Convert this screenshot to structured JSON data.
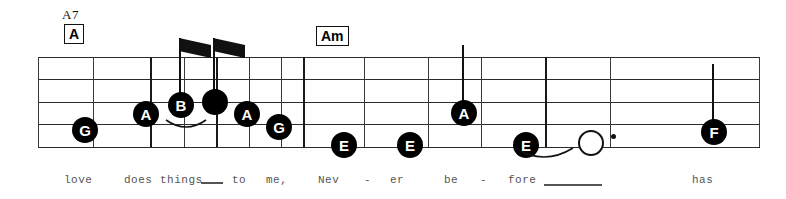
{
  "page": {
    "width": 786,
    "height": 199,
    "background": "#ffffff",
    "ink_color": "#111111",
    "staff_line_color": "#2b2b2b",
    "lyric_color": "#555555"
  },
  "staff": {
    "name": "music-staff",
    "line_count": 5,
    "left": 38,
    "right": 760,
    "top_y": 57,
    "line_spacing": 22.5,
    "line_ys": [
      57,
      79,
      102,
      124,
      147
    ]
  },
  "chords": [
    {
      "label": "A7",
      "boxed": false,
      "x": 62,
      "y": 7
    },
    {
      "label": "A",
      "boxed": true,
      "x": 64,
      "y": 24
    },
    {
      "label": "Am",
      "boxed": true,
      "x": 316,
      "y": 26
    }
  ],
  "barlines": [
    {
      "name": "barline-m1-open",
      "x": 38,
      "style": "thin"
    },
    {
      "name": "barline-m1-a",
      "x": 93,
      "style": "thin"
    },
    {
      "name": "barline-m1-b",
      "x": 150,
      "style": "thick"
    },
    {
      "name": "barline-m1-c",
      "x": 184,
      "style": "thin"
    },
    {
      "name": "barline-m1-d",
      "x": 216,
      "style": "thick"
    },
    {
      "name": "barline-m1-e",
      "x": 249,
      "style": "thin"
    },
    {
      "name": "barline-m1-f",
      "x": 281,
      "style": "thin"
    },
    {
      "name": "barline-measure-1-end",
      "x": 303,
      "style": "thick"
    },
    {
      "name": "barline-m2-a",
      "x": 364,
      "style": "thin"
    },
    {
      "name": "barline-m2-b",
      "x": 428,
      "style": "thin"
    },
    {
      "name": "barline-m2-c",
      "x": 481,
      "style": "thin"
    },
    {
      "name": "barline-measure-2-end",
      "x": 545,
      "style": "thick"
    },
    {
      "name": "barline-m3-a",
      "x": 610,
      "style": "thin"
    },
    {
      "name": "barline-staff-end",
      "x": 759,
      "style": "thin"
    }
  ],
  "notes": [
    {
      "name": "note-g-1",
      "letter": "G",
      "x": 72,
      "cy": 130,
      "head": "filled",
      "stem": "none",
      "flag": false
    },
    {
      "name": "note-a-1",
      "letter": "A",
      "x": 133,
      "cy": 114,
      "head": "filled",
      "stem": "none",
      "flag": false
    },
    {
      "name": "note-b-1",
      "letter": "B",
      "x": 168,
      "cy": 105,
      "head": "filled",
      "stem": "up",
      "stem_top": 38,
      "flag": true
    },
    {
      "name": "note-unlabeled-1",
      "letter": "",
      "x": 202,
      "cy": 102,
      "head": "blank",
      "stem": "up",
      "stem_top": 38,
      "flag": true
    },
    {
      "name": "note-a-2",
      "letter": "A",
      "x": 234,
      "cy": 114,
      "head": "filled",
      "stem": "none",
      "flag": false
    },
    {
      "name": "note-g-2",
      "letter": "G",
      "x": 266,
      "cy": 127,
      "head": "filled",
      "stem": "none",
      "flag": false
    },
    {
      "name": "note-e-1",
      "letter": "E",
      "x": 331,
      "cy": 145,
      "head": "filled",
      "stem": "none",
      "flag": false
    },
    {
      "name": "note-e-2",
      "letter": "E",
      "x": 397,
      "cy": 145,
      "head": "filled",
      "stem": "none",
      "flag": false
    },
    {
      "name": "note-a-3",
      "letter": "A",
      "x": 451,
      "cy": 113,
      "head": "filled",
      "stem": "up",
      "stem_top": 45,
      "flag": false
    },
    {
      "name": "note-e-3",
      "letter": "E",
      "x": 513,
      "cy": 145,
      "head": "filled",
      "stem": "none",
      "flag": false
    },
    {
      "name": "note-hollow-1",
      "letter": "",
      "x": 578,
      "cy": 143,
      "head": "hollow",
      "stem": "none",
      "flag": false,
      "dotted": true
    },
    {
      "name": "note-f-1",
      "letter": "F",
      "x": 701,
      "cy": 132,
      "head": "filled",
      "stem": "up",
      "stem_top": 64,
      "flag": false
    }
  ],
  "curves": [
    {
      "name": "slur-b-to-unlabeled",
      "x": 164,
      "y": 118,
      "width": 44,
      "height": 14
    },
    {
      "name": "tie-e-to-hollow",
      "x": 513,
      "y": 146,
      "width": 62,
      "height": 18
    }
  ],
  "lyrics": [
    {
      "name": "lyric-love",
      "text": "love",
      "x": 64,
      "y": 174
    },
    {
      "name": "lyric-does",
      "text": "does",
      "x": 124,
      "y": 174
    },
    {
      "name": "lyric-things",
      "text": "things",
      "x": 160,
      "y": 174
    },
    {
      "name": "lyric-to",
      "text": "to",
      "x": 232,
      "y": 174
    },
    {
      "name": "lyric-me",
      "text": "me,",
      "x": 266,
      "y": 174
    },
    {
      "name": "lyric-nev",
      "text": "Nev",
      "x": 318,
      "y": 174
    },
    {
      "name": "lyric-hyphen-1",
      "text": "-",
      "x": 364,
      "y": 174
    },
    {
      "name": "lyric-er",
      "text": "er",
      "x": 390,
      "y": 174
    },
    {
      "name": "lyric-be",
      "text": "be",
      "x": 444,
      "y": 174
    },
    {
      "name": "lyric-hyphen-2",
      "text": "-",
      "x": 480,
      "y": 174
    },
    {
      "name": "lyric-fore",
      "text": "fore",
      "x": 508,
      "y": 174
    },
    {
      "name": "lyric-has",
      "text": "has",
      "x": 692,
      "y": 174
    }
  ],
  "lyric_extensions": [
    {
      "name": "lyric-extension-things",
      "x": 201,
      "y": 182,
      "width": 22
    },
    {
      "name": "lyric-extension-fore",
      "x": 544,
      "y": 184,
      "width": 58
    }
  ]
}
